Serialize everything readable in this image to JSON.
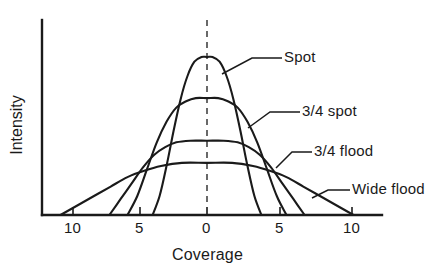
{
  "chart_data": {
    "type": "line",
    "title": "",
    "xlabel": "Coverage",
    "ylabel": "Intensity",
    "xlim": [
      -12,
      12
    ],
    "ylim": [
      0,
      1.05
    ],
    "grid": false,
    "legend": "inline-labels-right",
    "xticks": [
      {
        "value": -10,
        "label": "10"
      },
      {
        "value": -5,
        "label": "5"
      },
      {
        "value": 0,
        "label": "0"
      },
      {
        "value": 5,
        "label": "5"
      },
      {
        "value": 10,
        "label": "10"
      }
    ],
    "yticks": [],
    "annotations": [
      {
        "name": "center-line",
        "kind": "dashed-vertical",
        "x": 0
      }
    ],
    "series": [
      {
        "name": "Spot",
        "label": "Spot",
        "peak": 1.0,
        "half_width": 2.0,
        "x_zero_crossing": 3.9,
        "x": [
          -3.9,
          -3.4,
          -2.9,
          -2.4,
          -1.9,
          -1.4,
          -0.9,
          -0.4,
          0,
          0.4,
          0.9,
          1.4,
          1.9,
          2.4,
          2.9,
          3.4,
          3.9
        ],
        "y": [
          0.0,
          0.12,
          0.31,
          0.53,
          0.73,
          0.88,
          0.97,
          1.0,
          1.0,
          1.0,
          0.97,
          0.88,
          0.73,
          0.53,
          0.31,
          0.12,
          0.0
        ]
      },
      {
        "name": "3/4 spot",
        "label": "3/4 spot",
        "peak": 0.74,
        "half_width": 3.3,
        "x_zero_crossing": 5.7,
        "x": [
          -5.7,
          -5.0,
          -4.3,
          -3.6,
          -2.9,
          -2.2,
          -1.5,
          -0.8,
          0,
          0.8,
          1.5,
          2.2,
          2.9,
          3.6,
          4.3,
          5.0,
          5.7
        ],
        "y": [
          0.0,
          0.12,
          0.29,
          0.46,
          0.59,
          0.68,
          0.72,
          0.74,
          0.74,
          0.74,
          0.72,
          0.68,
          0.59,
          0.46,
          0.29,
          0.12,
          0.0
        ]
      },
      {
        "name": "3/4 flood",
        "label": "3/4 flood",
        "peak": 0.47,
        "half_width": 4.4,
        "x_zero_crossing": 7.0,
        "x": [
          -7.0,
          -6.2,
          -5.4,
          -4.6,
          -3.8,
          -3.0,
          -2.2,
          -1.2,
          0,
          1.2,
          2.2,
          3.0,
          3.8,
          4.6,
          5.4,
          6.2,
          7.0
        ],
        "y": [
          0.0,
          0.1,
          0.2,
          0.3,
          0.38,
          0.43,
          0.46,
          0.47,
          0.47,
          0.47,
          0.46,
          0.43,
          0.38,
          0.3,
          0.2,
          0.1,
          0.0
        ]
      },
      {
        "name": "Wide flood",
        "label": "Wide flood",
        "peak": 0.33,
        "half_width": 6.0,
        "x_zero_crossing": 10.5,
        "x": [
          -10.5,
          -9.3,
          -8.1,
          -6.9,
          -5.7,
          -4.5,
          -3.3,
          -1.8,
          0,
          1.8,
          3.3,
          4.5,
          5.7,
          6.9,
          8.1,
          9.3,
          10.5
        ],
        "y": [
          0.0,
          0.06,
          0.12,
          0.18,
          0.24,
          0.28,
          0.31,
          0.33,
          0.33,
          0.33,
          0.31,
          0.28,
          0.24,
          0.18,
          0.12,
          0.06,
          0.0
        ]
      }
    ]
  },
  "axes": {
    "x_title": "Coverage",
    "y_title": "Intensity",
    "tick_0": "10",
    "tick_1": "5",
    "tick_2": "0",
    "tick_3": "5",
    "tick_4": "10"
  },
  "labels": {
    "spot": "Spot",
    "three_quarter_spot": "3/4 spot",
    "three_quarter_flood": "3/4 flood",
    "wide_flood": "Wide flood"
  },
  "style": {
    "line_color": "#1a1a1a",
    "text_color": "#1a1a1a",
    "background": "#ffffff"
  }
}
